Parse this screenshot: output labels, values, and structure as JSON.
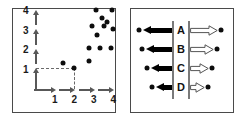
{
  "figure": {
    "panels": [
      {
        "id": "scatter-plot",
        "role": "left"
      },
      {
        "id": "flow-diagram",
        "role": "right"
      }
    ]
  },
  "chart_data": [
    {
      "type": "scatter",
      "title": "",
      "xlabel": "",
      "ylabel": "",
      "xlim": [
        0,
        4.5
      ],
      "ylim": [
        0,
        4.5
      ],
      "grid": false,
      "legend": null,
      "xticks": [
        "1",
        "2",
        "3",
        "4"
      ],
      "yticks": [
        "1",
        "2",
        "3",
        "4"
      ],
      "xtick_values": [
        1,
        2,
        3,
        4
      ],
      "ytick_values": [
        1,
        2,
        3,
        4
      ],
      "points": [
        {
          "x": 3.15,
          "y": 4.05
        },
        {
          "x": 3.95,
          "y": 4.05
        },
        {
          "x": 3.45,
          "y": 3.62
        },
        {
          "x": 3.7,
          "y": 3.42
        },
        {
          "x": 2.9,
          "y": 3.25
        },
        {
          "x": 3.55,
          "y": 3.22
        },
        {
          "x": 3.98,
          "y": 3.1
        },
        {
          "x": 3.2,
          "y": 2.78
        },
        {
          "x": 2.78,
          "y": 2.12
        },
        {
          "x": 3.35,
          "y": 2.1
        },
        {
          "x": 3.92,
          "y": 2.08
        },
        {
          "x": 2.78,
          "y": 1.42
        },
        {
          "x": 1.45,
          "y": 1.32
        },
        {
          "x": 2.0,
          "y": 1.1
        }
      ],
      "annotations": [
        {
          "kind": "dashed-guide",
          "from": [
            0,
            1.1
          ],
          "to": [
            2.0,
            1.1
          ]
        },
        {
          "kind": "dashed-guide",
          "from": [
            2.0,
            1.1
          ],
          "to": [
            2.0,
            0
          ]
        }
      ],
      "axis_style": "segmented-arrows"
    },
    {
      "type": "diagram",
      "title": "",
      "rows": [
        {
          "label": "A",
          "in_arrow_length": 64,
          "out_arrow_length": 56
        },
        {
          "label": "B",
          "in_arrow_length": 57,
          "out_arrow_length": 48
        },
        {
          "label": "C",
          "in_arrow_length": 45,
          "out_arrow_length": 38
        },
        {
          "label": "D",
          "in_arrow_length": 35,
          "out_arrow_length": 30
        }
      ],
      "in_arrow_color": "#000000",
      "out_arrow_color": "#ffffff",
      "out_arrow_stroke": "#555555",
      "endpoint_dot_color": "#0d0d0d",
      "separator_color": "#7a7a7a"
    }
  ],
  "style": {
    "panel_border": "#4a4a4a",
    "axis_color": "#585858",
    "dot_color": "#0d0d0d",
    "dash_color": "#6a6a6a",
    "background": "#ffffff"
  }
}
